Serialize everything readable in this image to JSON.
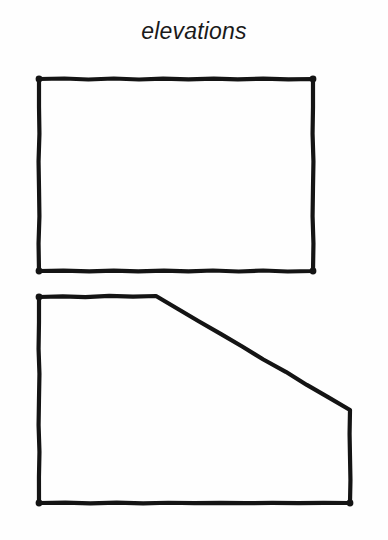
{
  "page": {
    "title": "elevations",
    "background_color": "#fefefe",
    "ink_color": "#141414",
    "width": 388,
    "height": 540
  },
  "drawing": {
    "kind": "architectural-elevation-sketch",
    "style": "hand-drawn line sketch, no fill, no dimensions, no labels on shapes",
    "stroke_width_px": 4,
    "figures": [
      {
        "id": "front-elevation",
        "name": "front-elevation-rectangle",
        "shape": "rectangle",
        "closed": true,
        "points": [
          [
            39,
            79
          ],
          [
            313,
            79
          ],
          [
            313,
            271
          ],
          [
            39,
            271
          ]
        ],
        "width_px": 274,
        "height_px": 192,
        "corner_markers": [
          [
            39,
            79
          ],
          [
            313,
            79
          ],
          [
            313,
            271
          ],
          [
            39,
            271
          ]
        ]
      },
      {
        "id": "side-elevation",
        "name": "side-elevation-pentagon",
        "shape": "pentagon",
        "closed": true,
        "points": [
          [
            39,
            297
          ],
          [
            156,
            296
          ],
          [
            350,
            410
          ],
          [
            350,
            503
          ],
          [
            39,
            503
          ]
        ],
        "width_px": 311,
        "height_px": 207,
        "sloped_edge": {
          "from": [
            156,
            296
          ],
          "to": [
            350,
            410
          ]
        },
        "corner_markers": [
          [
            39,
            297
          ],
          [
            39,
            503
          ],
          [
            350,
            503
          ]
        ]
      }
    ]
  }
}
